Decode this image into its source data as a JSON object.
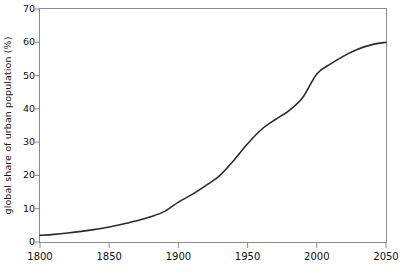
{
  "chart_data": {
    "type": "line",
    "title": "",
    "subtitle": "",
    "xlabel": "",
    "ylabel": "global share of urban population (%)",
    "xlim": [
      1800,
      2050
    ],
    "ylim": [
      0,
      70
    ],
    "grid": false,
    "legend": null,
    "legend_position": "none",
    "annotations": [],
    "xticks": [
      1800,
      1850,
      1900,
      1950,
      2000,
      2050
    ],
    "xtick_labels": [
      "1800",
      "1850",
      "1900",
      "1950",
      "2000",
      "2050"
    ],
    "yticks": [
      0,
      10,
      20,
      30,
      40,
      50,
      60,
      70
    ],
    "ytick_labels": [
      "0",
      "10",
      "20",
      "30",
      "40",
      "50",
      "60",
      "70"
    ],
    "series": [
      {
        "name": "global share of urban population",
        "color": "#2b2b2b",
        "x": [
          1800,
          1810,
          1820,
          1830,
          1840,
          1850,
          1860,
          1870,
          1880,
          1890,
          1900,
          1910,
          1920,
          1930,
          1940,
          1950,
          1960,
          1970,
          1980,
          1990,
          2000,
          2010,
          2020,
          2030,
          2040,
          2050
        ],
        "values": [
          2.0,
          2.3,
          2.7,
          3.2,
          3.8,
          4.5,
          5.4,
          6.4,
          7.6,
          9.2,
          12.0,
          14.3,
          17.0,
          20.0,
          24.5,
          29.5,
          33.8,
          36.8,
          39.5,
          43.5,
          50.5,
          53.5,
          56.0,
          58.0,
          59.3,
          60.0
        ]
      }
    ]
  },
  "axes": {
    "y_axis_title": "global share of urban population (%)"
  }
}
